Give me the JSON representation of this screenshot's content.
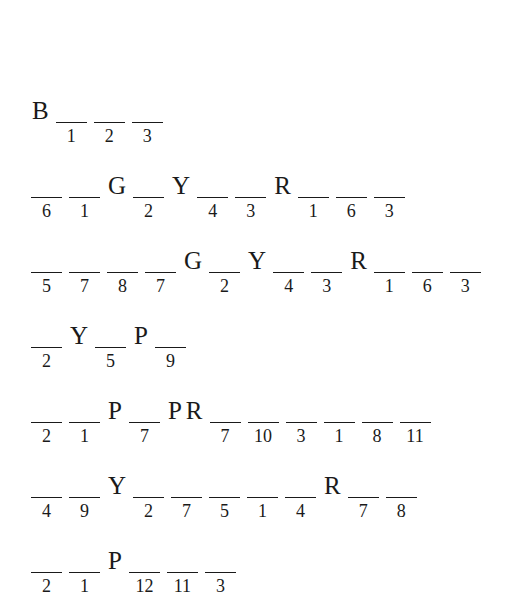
{
  "puzzle": {
    "lines": [
      {
        "tokens": [
          {
            "type": "letter",
            "value": "B"
          },
          {
            "type": "blank",
            "number": "1"
          },
          {
            "type": "blank",
            "number": "2"
          },
          {
            "type": "blank",
            "number": "3"
          }
        ]
      },
      {
        "tokens": [
          {
            "type": "blank",
            "number": "6"
          },
          {
            "type": "blank",
            "number": "1"
          },
          {
            "type": "letter",
            "value": "G"
          },
          {
            "type": "blank",
            "number": "2"
          },
          {
            "type": "letter",
            "value": "Y"
          },
          {
            "type": "blank",
            "number": "4"
          },
          {
            "type": "blank",
            "number": "3"
          },
          {
            "type": "letter",
            "value": "R"
          },
          {
            "type": "blank",
            "number": "1"
          },
          {
            "type": "blank",
            "number": "6"
          },
          {
            "type": "blank",
            "number": "3"
          }
        ]
      },
      {
        "tokens": [
          {
            "type": "blank",
            "number": "5"
          },
          {
            "type": "blank",
            "number": "7"
          },
          {
            "type": "blank",
            "number": "8"
          },
          {
            "type": "blank",
            "number": "7"
          },
          {
            "type": "letter",
            "value": "G"
          },
          {
            "type": "blank",
            "number": "2"
          },
          {
            "type": "letter",
            "value": "Y"
          },
          {
            "type": "blank",
            "number": "4"
          },
          {
            "type": "blank",
            "number": "3"
          },
          {
            "type": "letter",
            "value": "R"
          },
          {
            "type": "blank",
            "number": "1"
          },
          {
            "type": "blank",
            "number": "6"
          },
          {
            "type": "blank",
            "number": "3"
          }
        ]
      },
      {
        "tokens": [
          {
            "type": "blank",
            "number": "2"
          },
          {
            "type": "letter",
            "value": "Y"
          },
          {
            "type": "blank",
            "number": "5"
          },
          {
            "type": "letter",
            "value": "P"
          },
          {
            "type": "blank",
            "number": "9"
          }
        ]
      },
      {
        "tokens": [
          {
            "type": "blank",
            "number": "2"
          },
          {
            "type": "blank",
            "number": "1"
          },
          {
            "type": "letter",
            "value": "P"
          },
          {
            "type": "blank",
            "number": "7"
          },
          {
            "type": "letter",
            "value": "P"
          },
          {
            "type": "letter",
            "value": "R"
          },
          {
            "type": "blank",
            "number": "7"
          },
          {
            "type": "blank",
            "number": "10"
          },
          {
            "type": "blank",
            "number": "3"
          },
          {
            "type": "blank",
            "number": "1"
          },
          {
            "type": "blank",
            "number": "8"
          },
          {
            "type": "blank",
            "number": "11"
          }
        ]
      },
      {
        "tokens": [
          {
            "type": "blank",
            "number": "4"
          },
          {
            "type": "blank",
            "number": "9"
          },
          {
            "type": "letter",
            "value": "Y"
          },
          {
            "type": "blank",
            "number": "2"
          },
          {
            "type": "blank",
            "number": "7"
          },
          {
            "type": "blank",
            "number": "5"
          },
          {
            "type": "blank",
            "number": "1"
          },
          {
            "type": "blank",
            "number": "4"
          },
          {
            "type": "letter",
            "value": "R"
          },
          {
            "type": "blank",
            "number": "7"
          },
          {
            "type": "blank",
            "number": "8"
          }
        ]
      },
      {
        "tokens": [
          {
            "type": "blank",
            "number": "2"
          },
          {
            "type": "blank",
            "number": "1"
          },
          {
            "type": "letter",
            "value": "P"
          },
          {
            "type": "blank",
            "number": "12"
          },
          {
            "type": "blank",
            "number": "11"
          },
          {
            "type": "blank",
            "number": "3"
          }
        ]
      }
    ]
  }
}
